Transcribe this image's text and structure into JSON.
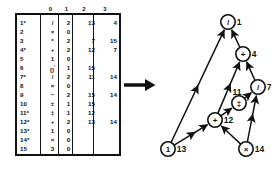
{
  "figure": {
    "kind": "triples-table-and-dag"
  },
  "table": {
    "column_headers": [
      "0",
      "1",
      "2",
      "3"
    ],
    "rows": [
      {
        "index": "1*",
        "op": "/",
        "n1": "2",
        "n2": "13",
        "n3": "4"
      },
      {
        "index": "2",
        "op": "×",
        "n1": "0",
        "n2": "",
        "n3": ""
      },
      {
        "index": "3",
        "op": "*",
        "n1": "2",
        "n2": "7",
        "n3": "15"
      },
      {
        "index": "4*",
        "op": "+",
        "n1": "2",
        "n2": "12",
        "n3": "7"
      },
      {
        "index": "5",
        "op": "1",
        "n1": "0",
        "n2": "",
        "n3": ""
      },
      {
        "index": "6",
        "op": "()'",
        "n1": "1",
        "n2": "15",
        "n3": ""
      },
      {
        "index": "7*",
        "op": "/",
        "n1": "2",
        "n2": "11",
        "n3": "14"
      },
      {
        "index": "8",
        "op": "×",
        "n1": "0",
        "n2": "",
        "n3": ""
      },
      {
        "index": "9",
        "op": "−",
        "n1": "2",
        "n2": "15",
        "n3": "14"
      },
      {
        "index": "10",
        "op": "±",
        "n1": "1",
        "n2": "15",
        "n3": ""
      },
      {
        "index": "11*",
        "op": "‡",
        "n1": "1",
        "n2": "12",
        "n3": ""
      },
      {
        "index": "12*",
        "op": "+",
        "n1": "2",
        "n2": "13",
        "n3": "14"
      },
      {
        "index": "13*",
        "op": "1",
        "n1": "0",
        "n2": "",
        "n3": ""
      },
      {
        "index": "14*",
        "op": "×",
        "n1": "0",
        "n2": "",
        "n3": ""
      },
      {
        "index": "15",
        "op": "3",
        "n1": "0",
        "n2": "",
        "n3": ""
      }
    ]
  },
  "arrow": {
    "name": "transform-arrow"
  },
  "graph": {
    "nodes": [
      {
        "id": "n1",
        "glyph": "/",
        "label": "1",
        "cx": 83,
        "cy": 20
      },
      {
        "id": "n4",
        "glyph": "+",
        "label": "4",
        "cx": 98,
        "cy": 52
      },
      {
        "id": "n7",
        "glyph": "/",
        "label": "7",
        "cx": 113,
        "cy": 85
      },
      {
        "id": "n11",
        "glyph": "‡",
        "label": "11",
        "cx": 94,
        "cy": 101
      },
      {
        "id": "n12",
        "glyph": "+",
        "label": "12",
        "cx": 70,
        "cy": 118
      },
      {
        "id": "n13",
        "glyph": "1",
        "label": "13",
        "cx": 23,
        "cy": 147
      },
      {
        "id": "n14",
        "glyph": "×",
        "label": "14",
        "cx": 101,
        "cy": 147
      }
    ],
    "edges": [
      {
        "from": "n13",
        "to": "n1"
      },
      {
        "from": "n4",
        "to": "n1"
      },
      {
        "from": "n12",
        "to": "n4"
      },
      {
        "from": "n7",
        "to": "n4"
      },
      {
        "from": "n11",
        "to": "n7"
      },
      {
        "from": "n14",
        "to": "n7"
      },
      {
        "from": "n12",
        "to": "n11"
      },
      {
        "from": "n13",
        "to": "n12"
      },
      {
        "from": "n14",
        "to": "n12"
      }
    ]
  }
}
